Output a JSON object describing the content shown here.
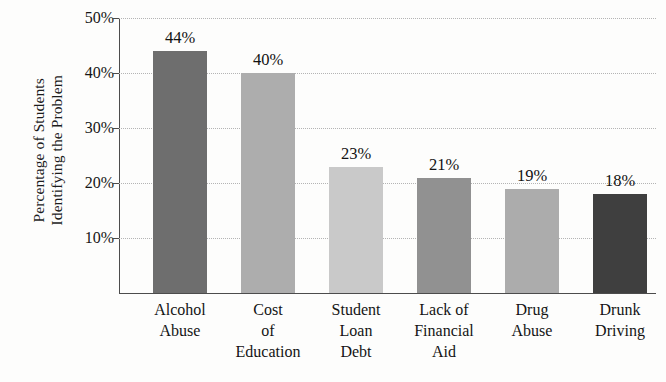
{
  "chart_data": {
    "type": "bar",
    "title": "",
    "subtitle": "",
    "xlabel": "",
    "ylabel": "Percentage of Students Identifying the Problem",
    "ylabel_lines": [
      "Percentage of Students",
      "Identifying the Problem"
    ],
    "categories": [
      "Alcohol Abuse",
      "Cost of Education",
      "Student Loan Debt",
      "Lack of Financial Aid",
      "Drug Abuse",
      "Drunk Driving"
    ],
    "category_lines": [
      [
        "Alcohol",
        "Abuse"
      ],
      [
        "Cost",
        "of",
        "Education"
      ],
      [
        "Student",
        "Loan",
        "Debt"
      ],
      [
        "Lack of",
        "Financial",
        "Aid"
      ],
      [
        "Drug",
        "Abuse"
      ],
      [
        "Drunk",
        "Driving"
      ]
    ],
    "values": [
      44,
      40,
      23,
      21,
      19,
      18
    ],
    "value_labels": [
      "44%",
      "40%",
      "23%",
      "21%",
      "19%",
      "18%"
    ],
    "bar_colors": [
      "#6e6e6e",
      "#adadad",
      "#c9c9c9",
      "#919191",
      "#acacac",
      "#3f3f3f"
    ],
    "ylim": [
      0,
      50
    ],
    "yticks": [
      10,
      20,
      30,
      40,
      50
    ],
    "ytick_labels": [
      "10%",
      "20%",
      "30%",
      "40%",
      "50%"
    ],
    "grid": true,
    "grid_style": "dotted",
    "legend": null,
    "legend_position": "none",
    "axis_color": "#4c4c4c",
    "grid_color": "#b4b4b4",
    "background": "#fdfdfc"
  }
}
